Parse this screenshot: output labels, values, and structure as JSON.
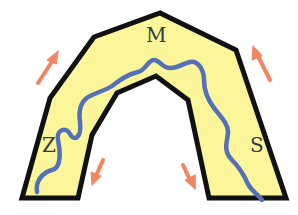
{
  "diagram": {
    "type": "fold/anticline schematic",
    "labels": {
      "left": "Z",
      "top": "M",
      "right": "S"
    },
    "colors": {
      "fill": "#fbf69a",
      "outline": "#111111",
      "river": "#5470b8",
      "arrows": "#f28560",
      "background": "#ffffff"
    },
    "arrows": [
      {
        "position": "upper-left",
        "direction": "up-right"
      },
      {
        "position": "upper-right",
        "direction": "up-left"
      },
      {
        "position": "lower-left-inner",
        "direction": "down-left"
      },
      {
        "position": "lower-right-inner",
        "direction": "down-right"
      }
    ]
  }
}
